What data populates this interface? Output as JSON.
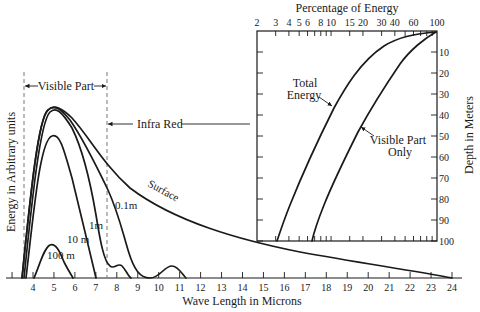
{
  "chart_data": [
    {
      "type": "line",
      "title": "",
      "xlabel": "Wave Length in Microns",
      "ylabel": "Energy in Arbitrary units",
      "xlim": [
        3.0,
        24.5
      ],
      "x_ticks": [
        4,
        5,
        6,
        7,
        8,
        9,
        10,
        11,
        12,
        13,
        14,
        15,
        16,
        17,
        18,
        19,
        20,
        21,
        22,
        23,
        24
      ],
      "grid": false,
      "regions": [
        {
          "label": "Visible Part",
          "x_from": 3.6,
          "x_to": 7.6
        },
        {
          "label": "Infra Red",
          "x_from": 7.6,
          "x_to": 24
        }
      ],
      "series": [
        {
          "name": "Surface",
          "points": [
            [
              3.6,
              0
            ],
            [
              4.0,
              55
            ],
            [
              4.5,
              92
            ],
            [
              5.0,
              100
            ],
            [
              5.5,
              98
            ],
            [
              6.0,
              92
            ],
            [
              7.0,
              78
            ],
            [
              8.0,
              62
            ],
            [
              9.0,
              48
            ],
            [
              10.0,
              38
            ],
            [
              11.0,
              31
            ],
            [
              12.0,
              25
            ],
            [
              14.0,
              17
            ],
            [
              16.0,
              12
            ],
            [
              18.0,
              8
            ],
            [
              20.0,
              5
            ],
            [
              22.0,
              3
            ],
            [
              24.0,
              0
            ]
          ]
        },
        {
          "name": "0.1m",
          "points": [
            [
              3.6,
              0
            ],
            [
              4.0,
              55
            ],
            [
              4.5,
              92
            ],
            [
              5.0,
              100
            ],
            [
              5.5,
              97
            ],
            [
              6.0,
              88
            ],
            [
              7.0,
              68
            ],
            [
              7.6,
              55
            ],
            [
              8.0,
              42
            ],
            [
              8.6,
              22
            ],
            [
              9.0,
              8
            ],
            [
              9.6,
              1
            ],
            [
              10.0,
              0
            ],
            [
              10.7,
              7
            ],
            [
              11.3,
              0
            ]
          ]
        },
        {
          "name": "1m",
          "points": [
            [
              3.7,
              0
            ],
            [
              4.0,
              52
            ],
            [
              4.5,
              90
            ],
            [
              5.0,
              98
            ],
            [
              5.5,
              93
            ],
            [
              6.0,
              80
            ],
            [
              6.5,
              58
            ],
            [
              7.0,
              30
            ],
            [
              7.3,
              10
            ],
            [
              7.6,
              4
            ],
            [
              8.0,
              6
            ],
            [
              8.5,
              0
            ]
          ]
        },
        {
          "name": "10m",
          "points": [
            [
              3.8,
              0
            ],
            [
              4.2,
              52
            ],
            [
              4.7,
              75
            ],
            [
              5.0,
              76
            ],
            [
              5.5,
              68
            ],
            [
              6.0,
              45
            ],
            [
              6.5,
              22
            ],
            [
              7.0,
              0
            ]
          ]
        },
        {
          "name": "100m",
          "points": [
            [
              4.2,
              0
            ],
            [
              4.5,
              12
            ],
            [
              4.8,
              16
            ],
            [
              5.2,
              14
            ],
            [
              5.6,
              6
            ],
            [
              5.9,
              0
            ]
          ]
        }
      ]
    },
    {
      "type": "line",
      "title": "Percentage of Energy",
      "xlabel": "Percentage of Energy",
      "ylabel": "Depth in Meters",
      "x_scale": "log",
      "xlim": [
        2,
        100
      ],
      "ylim": [
        0,
        100
      ],
      "y_inverted": true,
      "x_ticks": [
        2,
        3,
        4,
        5,
        6,
        8,
        10,
        15,
        20,
        30,
        40,
        60,
        100
      ],
      "y_ticks": [
        10,
        20,
        30,
        40,
        50,
        60,
        70,
        80,
        90,
        100
      ],
      "grid": false,
      "series": [
        {
          "name": "Total Energy",
          "points": [
            [
              100,
              0
            ],
            [
              60,
              2
            ],
            [
              40,
              5
            ],
            [
              25,
              14
            ],
            [
              15,
              28
            ],
            [
              10,
              42
            ],
            [
              7,
              56
            ],
            [
              5,
              70
            ],
            [
              4,
              84
            ],
            [
              3.2,
              100
            ]
          ]
        },
        {
          "name": "Visible Part Only",
          "points": [
            [
              100,
              0
            ],
            [
              70,
              4
            ],
            [
              50,
              10
            ],
            [
              35,
              20
            ],
            [
              25,
              33
            ],
            [
              18,
              47
            ],
            [
              13,
              62
            ],
            [
              10,
              76
            ],
            [
              8.5,
              88
            ],
            [
              7.5,
              100
            ]
          ]
        }
      ]
    }
  ],
  "main_chart": {
    "ylabel": "Energy in Arbitrary units",
    "xlabel": "Wave Length in Microns",
    "x_tick_labels": [
      "4",
      "5",
      "6",
      "7",
      "8",
      "9",
      "10",
      "11",
      "12",
      "13",
      "14",
      "15",
      "16",
      "17",
      "18",
      "19",
      "20",
      "21",
      "22",
      "23",
      "24"
    ],
    "annotations": {
      "visible": "Visible Part",
      "infrared": "Infra Red",
      "surface": "Surface",
      "m01": "0.1m",
      "m1": "1m",
      "m10": "10 m",
      "m100": "100 m"
    }
  },
  "inset_chart": {
    "title": "Percentage of Energy",
    "ylabel": "Depth in Meters",
    "x_tick_labels": [
      "2",
      "3",
      "4",
      "5",
      "6",
      "8",
      "10",
      "15",
      "20",
      "30",
      "40",
      "60",
      "100"
    ],
    "y_tick_labels": [
      "10",
      "20",
      "30",
      "40",
      "50",
      "60",
      "70",
      "80",
      "90",
      "100"
    ],
    "annotations": {
      "total_line1": "Total",
      "total_line2": "Energy",
      "visible_line1": "Visible Part",
      "visible_line2": "Only"
    }
  }
}
